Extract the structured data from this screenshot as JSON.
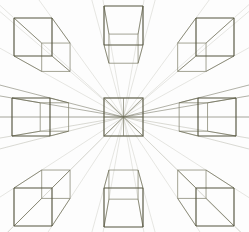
{
  "figure": {
    "canvas": {
      "width": 249,
      "height": 232,
      "background": "#fdfdfd"
    },
    "colors": {
      "edge_dark": "#55553f",
      "edge_mid": "#6e6e58",
      "edge_light": "#8d8d7a",
      "ray_faint": "#b9b9ad",
      "ray_fainter": "#d2d2c8",
      "ray_axis": "#6b6b58",
      "background": "#fdfdfd"
    },
    "stroke_widths": {
      "front_face": 1.15,
      "back_face": 0.85,
      "connector": 0.8,
      "ray": 0.55,
      "ray_axis": 0.7
    }
  },
  "vanishing_point": {
    "x": 123.5,
    "y": 117.0,
    "label": "central vanishing point"
  },
  "grid": {
    "rows": 3,
    "cols": 3,
    "cell_centers_x": [
      33,
      123.5,
      214
    ],
    "cell_centers_y": [
      27,
      117,
      205
    ],
    "cube_face_size": 38,
    "depth_ratio": 0.46
  },
  "cubes": [
    {
      "id": "cube-top-left",
      "name": "top-left cube",
      "position": "top-left",
      "row": 0,
      "col": 0,
      "front": {
        "x": 14,
        "y": 18,
        "w": 38,
        "h": 38
      },
      "recedes_toward": "lower-right",
      "depth_dx": 19.5,
      "depth_dy": -12.5,
      "shows_faces": [
        "front",
        "top",
        "right"
      ]
    },
    {
      "id": "cube-top-center",
      "name": "top-center cube",
      "position": "top-center",
      "row": 0,
      "col": 1,
      "front": {
        "x": 104,
        "y": 6,
        "w": 39,
        "h": 39
      },
      "recedes_toward": "down",
      "depth_dx": 0,
      "depth_dy": 14.5,
      "shows_faces": [
        "front",
        "top-inside"
      ]
    },
    {
      "id": "cube-top-right",
      "name": "top-right cube",
      "position": "top-right",
      "row": 0,
      "col": 2,
      "front": {
        "x": 196,
        "y": 18,
        "w": 38,
        "h": 38
      },
      "recedes_toward": "lower-left",
      "depth_dx": -19.5,
      "depth_dy": -12.5,
      "shows_faces": [
        "front",
        "top",
        "left"
      ]
    },
    {
      "id": "cube-middle-left",
      "name": "middle-left cube",
      "position": "middle-left",
      "row": 1,
      "col": 0,
      "front": {
        "x": 12,
        "y": 98,
        "w": 38,
        "h": 38
      },
      "recedes_toward": "right",
      "depth_dx": 15.5,
      "depth_dy": 0,
      "shows_faces": [
        "front",
        "right-inside"
      ]
    },
    {
      "id": "cube-center",
      "name": "center square at vanishing point",
      "position": "center",
      "row": 1,
      "col": 1,
      "front": {
        "x": 104,
        "y": 98,
        "w": 39,
        "h": 38
      },
      "recedes_toward": "none",
      "depth_dx": 0,
      "depth_dy": 0,
      "shows_faces": [
        "front"
      ]
    },
    {
      "id": "cube-middle-right",
      "name": "middle-right cube",
      "position": "middle-right",
      "row": 1,
      "col": 2,
      "front": {
        "x": 198,
        "y": 98,
        "w": 38,
        "h": 38
      },
      "recedes_toward": "left",
      "depth_dx": -15.5,
      "depth_dy": 0,
      "shows_faces": [
        "front",
        "left-inside"
      ]
    },
    {
      "id": "cube-bottom-left",
      "name": "bottom-left cube",
      "position": "bottom-left",
      "row": 2,
      "col": 0,
      "front": {
        "x": 14,
        "y": 188,
        "w": 38,
        "h": 38
      },
      "recedes_toward": "upper-right",
      "depth_dx": 19.5,
      "depth_dy": 12.5,
      "shows_faces": [
        "front",
        "bottom",
        "right"
      ]
    },
    {
      "id": "cube-bottom-center",
      "name": "bottom-center cube",
      "position": "bottom-center",
      "row": 2,
      "col": 1,
      "front": {
        "x": 104,
        "y": 188,
        "w": 39,
        "h": 39
      },
      "recedes_toward": "up",
      "depth_dx": 0,
      "depth_dy": -14.5,
      "shows_faces": [
        "front",
        "bottom-inside"
      ]
    },
    {
      "id": "cube-bottom-right",
      "name": "bottom-right cube",
      "position": "bottom-right",
      "row": 2,
      "col": 2,
      "front": {
        "x": 196,
        "y": 188,
        "w": 38,
        "h": 38
      },
      "recedes_toward": "upper-left",
      "depth_dx": -19.5,
      "depth_dy": 12.5,
      "shows_faces": [
        "front",
        "bottom",
        "left"
      ]
    }
  ],
  "construction_rays": {
    "description": "Faint straight guide lines drawn from the central vanishing point outward through every corner of each surrounding cube and continuing past the cube toward the image edges.",
    "count": 32,
    "origin": "vanishing_point",
    "style": "thin light gray"
  }
}
